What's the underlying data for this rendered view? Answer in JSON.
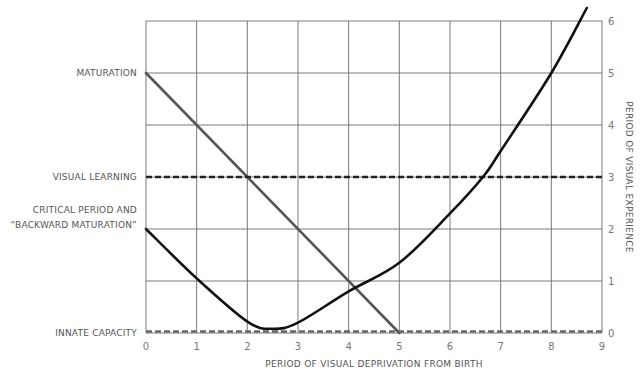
{
  "chart_data": {
    "type": "line",
    "title": "",
    "xlabel": "PERIOD OF VISUAL DEPRIVATION FROM BIRTH",
    "ylabel": "PERIOD OF VISUAL EXPERIENCE",
    "ylabel_position": "right",
    "xlim": [
      0,
      9
    ],
    "ylim": [
      0,
      6
    ],
    "x_ticks": [
      "0",
      "1",
      "2",
      "3",
      "4",
      "5",
      "6",
      "7",
      "8",
      "9"
    ],
    "y_ticks": [
      "0",
      "1",
      "2",
      "3",
      "4",
      "5",
      "6"
    ],
    "grid": true,
    "legend": "none (series labeled on left axis)",
    "category_labels": [
      {
        "text_lines": [
          "MATURATION"
        ],
        "y": 5
      },
      {
        "text_lines": [
          "VISUAL LEARNING"
        ],
        "y": 3
      },
      {
        "text_lines": [
          "CRITICAL PERIOD AND",
          "“BACKWARD MATURATION”"
        ],
        "y": 2
      },
      {
        "text_lines": [
          "INNATE CAPACITY"
        ],
        "y": 0
      }
    ],
    "series": [
      {
        "name": "MATURATION",
        "style": "solid",
        "color": "#555555",
        "points": [
          [
            0,
            5
          ],
          [
            5,
            0
          ]
        ]
      },
      {
        "name": "VISUAL LEARNING",
        "style": "dashed",
        "color": "#222222",
        "points": [
          [
            0,
            3
          ],
          [
            9,
            3
          ]
        ]
      },
      {
        "name": "CRITICAL PERIOD AND “BACKWARD MATURATION”",
        "style": "solid",
        "color": "#111111",
        "points": [
          [
            0,
            2
          ],
          [
            1,
            1.05
          ],
          [
            2,
            0.22
          ],
          [
            2.5,
            0.08
          ],
          [
            3,
            0.2
          ],
          [
            4,
            0.8
          ],
          [
            5,
            1.35
          ],
          [
            6,
            2.3
          ],
          [
            6.65,
            3
          ],
          [
            7,
            3.5
          ],
          [
            8,
            5
          ],
          [
            8.7,
            6.25
          ]
        ]
      },
      {
        "name": "INNATE CAPACITY",
        "style": "dashed",
        "color": "#666666",
        "points": [
          [
            0,
            0.03
          ],
          [
            9,
            0.03
          ]
        ]
      }
    ]
  }
}
